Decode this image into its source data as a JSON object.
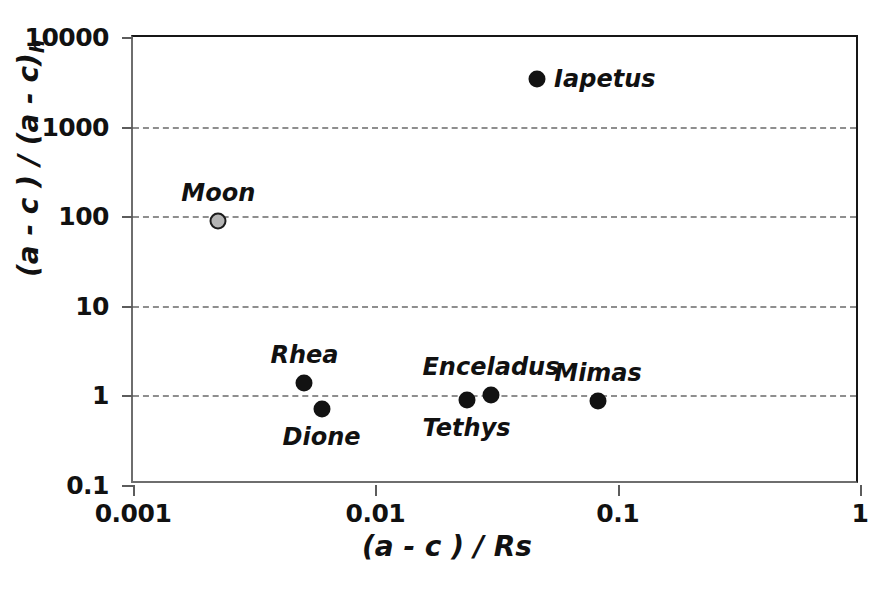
{
  "chart_data": {
    "type": "scatter",
    "title": "",
    "xlabel": "(a - c ) / Rs",
    "ylabel_main": "(a - c ) / (a - c)",
    "ylabel_sub": "h",
    "xscale": "log",
    "yscale": "log",
    "xlim": [
      0.001,
      1
    ],
    "ylim": [
      0.1,
      10000
    ],
    "xticks": [
      "0.001",
      "0.01",
      "0.1",
      "1"
    ],
    "xtick_values": [
      0.001,
      0.01,
      0.1,
      1
    ],
    "yticks": [
      "0.1",
      "1",
      "10",
      "100",
      "1000",
      "10000"
    ],
    "ytick_values": [
      0.1,
      1,
      10,
      100,
      1000,
      10000
    ],
    "grid": "horizontal-dashed",
    "gridlines_at": [
      1000,
      100,
      10,
      1
    ],
    "legend": "none",
    "colors": {
      "marker_dark": "#121212",
      "marker_gray": "#b4b4b4",
      "marker_gray_edge": "#1c1c1c",
      "gridline": "#8e8e8e",
      "axis": "#161616",
      "text": "#111111"
    },
    "points": [
      {
        "name": "Iapetus",
        "x": 0.0465,
        "y": 3400,
        "marker": "dark",
        "label_pos": "right"
      },
      {
        "name": "Moon",
        "x": 0.00225,
        "y": 88,
        "marker": "gray",
        "label_pos": "above"
      },
      {
        "name": "Rhea",
        "x": 0.0051,
        "y": 1.38,
        "marker": "dark",
        "label_pos": "above"
      },
      {
        "name": "Dione",
        "x": 0.006,
        "y": 0.71,
        "marker": "dark",
        "label_pos": "below"
      },
      {
        "name": "Tethys",
        "x": 0.0238,
        "y": 0.88,
        "marker": "dark",
        "label_pos": "below"
      },
      {
        "name": "Enceladus",
        "x": 0.03,
        "y": 1.02,
        "marker": "dark",
        "label_pos": "above"
      },
      {
        "name": "Mimas",
        "x": 0.083,
        "y": 0.86,
        "marker": "dark",
        "label_pos": "above"
      }
    ]
  }
}
